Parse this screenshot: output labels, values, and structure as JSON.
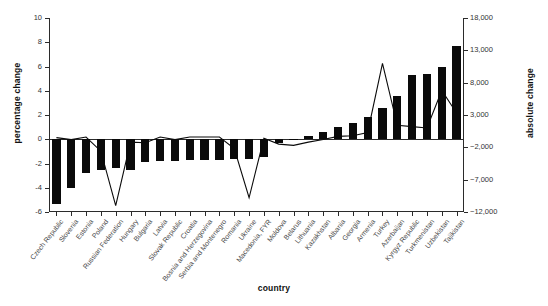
{
  "chart_data": {
    "type": "bar",
    "title": "",
    "xlabel": "country",
    "ylabel": "percentage change",
    "ylabel_right": "absolute change",
    "ylim": [
      -6,
      10
    ],
    "ylim_right": [
      -12000,
      18000
    ],
    "yticks": [
      "10",
      "8",
      "6",
      "4",
      "2",
      "0",
      "-2",
      "-4",
      "-6"
    ],
    "ytick_values": [
      10,
      8,
      6,
      4,
      2,
      0,
      -2,
      -4,
      -6
    ],
    "yticks_right": [
      "18,000",
      "13,000",
      "8,000",
      "3,000",
      "−2,000",
      "−7,000",
      "−12,000"
    ],
    "ytick_values_right": [
      18000,
      13000,
      8000,
      3000,
      -2000,
      -7000,
      -12000
    ],
    "grid": false,
    "legend": "none",
    "categories": [
      "Czech Republic",
      "Slovenia",
      "Estonia",
      "Poland",
      "Russian Federation",
      "Hungary",
      "Bulgaria",
      "Latvia",
      "Slovak Republic",
      "Croatia",
      "Bosnia and Herzegovina",
      "Serbia and Montenegro",
      "Romania",
      "Ukraine",
      "Macedonia, FYR",
      "Moldova",
      "Belarus",
      "Lithuania",
      "Kazakhstan",
      "Albania",
      "Georgia",
      "Armenia",
      "Turkey",
      "Azerbaijan",
      "Kyrgyz Republic",
      "Turkmenistan",
      "Uzbekistan",
      "Tajikistan"
    ],
    "series": [
      {
        "name": "percentage change",
        "axis": "left",
        "render": "bar",
        "values": [
          -5.3,
          -4.0,
          -2.8,
          -2.5,
          -2.4,
          -2.5,
          -1.9,
          -1.8,
          -1.8,
          -1.7,
          -1.7,
          -1.7,
          -1.6,
          -1.6,
          -1.5,
          -0.3,
          -0.1,
          0.3,
          0.6,
          1.0,
          1.3,
          1.8,
          2.6,
          3.6,
          5.3,
          5.4,
          6.0,
          7.7
        ]
      },
      {
        "name": "absolute change",
        "axis": "right",
        "render": "line",
        "values": [
          -500,
          -800,
          -400,
          -2600,
          -11000,
          -1200,
          -1300,
          -400,
          -800,
          -400,
          -400,
          -400,
          -2200,
          -9800,
          -600,
          -1500,
          -1700,
          -1200,
          -800,
          -300,
          -200,
          300,
          11000,
          1400,
          1200,
          1000,
          6800,
          3300
        ]
      }
    ]
  }
}
